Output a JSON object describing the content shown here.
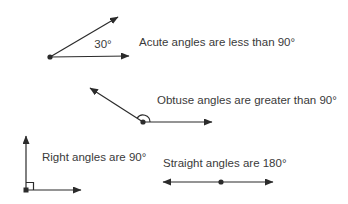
{
  "colors": {
    "background": "#ffffff",
    "line": "#2b2b2b",
    "text": "#3a3a3a"
  },
  "figure": {
    "acute": {
      "degree_label": "30°",
      "caption": "Acute angles are less than 90°"
    },
    "obtuse": {
      "caption": "Obtuse angles are greater than 90°"
    },
    "right_angle": {
      "caption": "Right angles are 90°"
    },
    "straight": {
      "caption": "Straight angles are 180°"
    }
  }
}
